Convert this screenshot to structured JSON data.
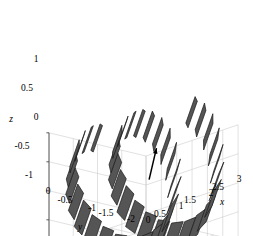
{
  "figure": {
    "kind": "matlab-3d-surface-plot",
    "background": "#ffffff",
    "patch_fill": "#555555",
    "patch_edge": "#1a1a1a",
    "grid_color": "#c8c8c8",
    "axis_color": "#4d4d4d",
    "annotation_color": "#000000"
  },
  "chart_data": {
    "type": "line",
    "title": "",
    "subtitle": "",
    "xlabel": "x",
    "ylabel": "y",
    "zlabel": "z",
    "grid": true,
    "legend": "none",
    "xlim": [
      0,
      3
    ],
    "ylim": [
      -2,
      0
    ],
    "zlim": [
      -1,
      1
    ],
    "xticks": [
      0,
      0.5,
      1,
      1.5,
      2,
      2.5,
      3
    ],
    "xticklabels": [
      "0",
      "0.5",
      "1",
      "1.5",
      "2",
      "2.5",
      "3"
    ],
    "yticks": [
      0,
      -0.5,
      -1,
      -1.5,
      -2
    ],
    "yticklabels": [
      "0",
      "-0.5",
      "-1",
      "-1.5",
      "-2"
    ],
    "zticks": [
      -1,
      -0.5,
      0,
      0.5,
      1
    ],
    "zticklabels": [
      "-1",
      "-0.5",
      "0",
      "0.5",
      "1"
    ],
    "series": [
      {
        "name": "helical ribbon (twisted strip)",
        "representation": "discrete flat quadrilateral patches along a helix",
        "turns": 2,
        "patch_count": 44,
        "helix_radius": 1.0,
        "pitch_per_turn": 1.35,
        "x": [
          0.15,
          1.5,
          2.9
        ],
        "y": [
          -1.0,
          -1.0,
          -1.0
        ],
        "z": [
          0.0,
          1.0,
          -1.0
        ]
      }
    ],
    "annotations": [
      {
        "name": "direction-arrow",
        "type": "arrow",
        "label": "",
        "x_start": 0.18,
        "z_start": 0.55,
        "x_end": 0.42,
        "z_end": 1.05
      }
    ]
  },
  "axes": {
    "z": {
      "label": "z",
      "ticks": [
        {
          "text": "1",
          "x": 36,
          "y": 62
        },
        {
          "text": "0.5",
          "x": 27,
          "y": 91
        },
        {
          "text": "0",
          "x": 36,
          "y": 120
        },
        {
          "text": "-0.5",
          "x": 22,
          "y": 149
        },
        {
          "text": "-1",
          "x": 29,
          "y": 178
        }
      ],
      "label_pos": {
        "x": 11,
        "y": 122
      }
    },
    "y": {
      "label": "y",
      "ticks": [
        {
          "text": "0",
          "x": 48,
          "y": 194
        },
        {
          "text": "-0.5",
          "x": 65,
          "y": 203
        },
        {
          "text": "-1",
          "x": 92,
          "y": 211
        },
        {
          "text": "-1.5",
          "x": 106,
          "y": 216
        },
        {
          "text": "-2",
          "x": 131,
          "y": 222
        }
      ],
      "label_pos": {
        "x": 80,
        "y": 230
      }
    },
    "x": {
      "label": "x",
      "ticks": [
        {
          "text": "0",
          "x": 148,
          "y": 223
        },
        {
          "text": "0.5",
          "x": 160,
          "y": 217
        },
        {
          "text": "1",
          "x": 181,
          "y": 209
        },
        {
          "text": "1.5",
          "x": 190,
          "y": 203
        },
        {
          "text": "2",
          "x": 211,
          "y": 196
        },
        {
          "text": "2.5",
          "x": 218,
          "y": 190
        },
        {
          "text": "3",
          "x": 239,
          "y": 182
        }
      ],
      "label_pos": {
        "x": 222,
        "y": 205
      }
    }
  }
}
